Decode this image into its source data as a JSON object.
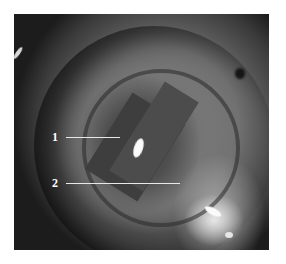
{
  "figure": {
    "annotations": [
      {
        "label": "1"
      },
      {
        "label": "2"
      }
    ],
    "colors": {
      "background": "#ffffff",
      "label_text": "#ffffff",
      "leader_line": "#e8e8e8"
    }
  }
}
